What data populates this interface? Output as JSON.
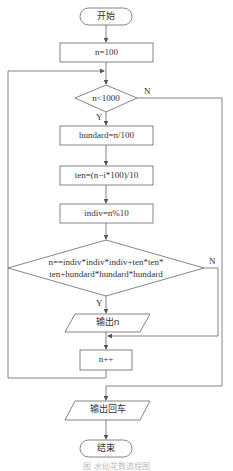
{
  "flowchart": {
    "start": "开始",
    "init": "n=100",
    "loop_condition": "n<1000",
    "step_hundred": "hundard=n/100",
    "step_ten": "ten=(n−i*100)/10",
    "step_indiv": "indiv=n%10",
    "check_line1": "n==indiv*indiv*indiv+ten*ten*",
    "check_line2": "ten+hundard*hundard*hundard",
    "output_n": "输出n",
    "increment": "n++",
    "output_newline": "输出回车",
    "end": "结束",
    "yes_label": "Y",
    "no_label": "N"
  },
  "caption": "图 水仙花数流程图",
  "colors": {
    "line": "#555555",
    "text": "#333333",
    "background": "#ffffff"
  }
}
